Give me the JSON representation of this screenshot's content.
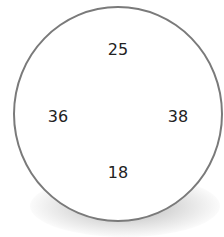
{
  "diagram": {
    "shape": "circle",
    "border_color": "#7a7a7a",
    "numbers": {
      "top": "25",
      "left": "36",
      "right": "38",
      "bottom": "18"
    }
  }
}
